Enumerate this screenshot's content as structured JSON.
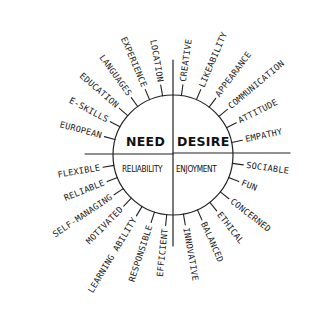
{
  "diagram": {
    "center": {
      "quadrants": [
        {
          "id": "need",
          "title": "NEED",
          "subtitle": "RELIABILITY"
        },
        {
          "id": "desire",
          "title": "DESIRE",
          "subtitle": "ENJOYMENT"
        }
      ]
    },
    "spokes": {
      "upper_left": [
        "EUROPEAN",
        "E-SKILLS",
        "EDUCATION",
        "LANGUAGES",
        "EXPERIENCE",
        "LOCATION"
      ],
      "upper_right": [
        "CREATIVE",
        "LIKEABILITY",
        "APPEARANCE",
        "COMMUNICATION",
        "ATTITUDE",
        "EMPATHY"
      ],
      "lower_left": [
        "FLEXIBLE",
        "RELIABLE",
        "SELF-MANAGING",
        "MOTIVATED",
        "LEARNING ABILITY",
        "RESPONSIBLE",
        "EFFICIENT"
      ],
      "lower_right": [
        "SOCIABLE",
        "FUN",
        "CONCERNED",
        "ETHICAL",
        "BALANCED",
        "INNOVATIVE"
      ]
    },
    "colors": {
      "ink": "#1a1a1a",
      "background": "#ffffff"
    }
  }
}
